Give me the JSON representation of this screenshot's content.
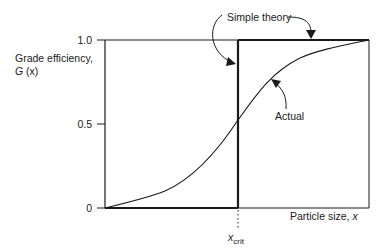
{
  "diagram": {
    "type": "grade-efficiency-curve",
    "y_axis": {
      "label_line1": "Grade efficiency,",
      "label_line2_var": "G",
      "label_line2_arg": "(x)",
      "ticks": [
        "1.0",
        "0.5",
        "0"
      ]
    },
    "x_axis": {
      "label": "Particle size,",
      "label_var": "x",
      "critical_marker_var": "x",
      "critical_marker_sub": "crit"
    },
    "annotations": {
      "simple_theory": "Simple theory",
      "actual": "Actual"
    },
    "curves": [
      {
        "name": "Simple theory",
        "description": "step function: 0 below x_crit, 1.0 above x_crit"
      },
      {
        "name": "Actual",
        "description": "S-shaped curve from 0 to 1.0, passing ~0.53 at x_crit"
      }
    ],
    "colors": {
      "line": "#1a1a1a",
      "background": "#ffffff"
    }
  }
}
